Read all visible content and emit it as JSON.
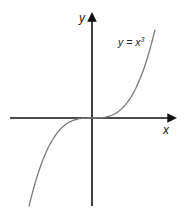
{
  "chart_data": {
    "type": "line",
    "title": "",
    "xlabel": "x",
    "ylabel": "y",
    "annotation": "y = x³",
    "annotation_parts": {
      "lhs": "y = x",
      "exponent": "3"
    },
    "function": "y = x^3",
    "series": [
      {
        "name": "y = x³",
        "x": [
          -1.75,
          -1.5,
          -1.25,
          -1.0,
          -0.75,
          -0.5,
          -0.25,
          0,
          0.25,
          0.5,
          0.75,
          1.0,
          1.25,
          1.5,
          1.75
        ],
        "values": [
          -5.36,
          -3.375,
          -1.953,
          -1.0,
          -0.422,
          -0.125,
          -0.016,
          0,
          0.016,
          0.125,
          0.422,
          1.0,
          1.953,
          3.375,
          5.36
        ]
      }
    ],
    "grid": false,
    "legend": "none",
    "ticks": "none",
    "colors": {
      "axes": "#111111",
      "curve": "#7a7a7a",
      "text": "#222222"
    }
  },
  "labels": {
    "x_axis": "x",
    "y_axis": "y",
    "curve_lhs": "y = x",
    "curve_exp": "3"
  }
}
